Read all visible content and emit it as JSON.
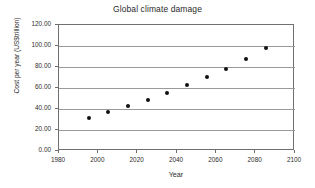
{
  "chart_data": {
    "type": "scatter",
    "title": "Global climate damage",
    "xlabel": "Year",
    "ylabel": "Cost per year (US$trillion)",
    "xlim": [
      1980,
      2100
    ],
    "ylim": [
      0,
      120
    ],
    "grid": true,
    "legend": "none",
    "xticks": [
      1980,
      2000,
      2020,
      2040,
      2060,
      2080,
      2100
    ],
    "xtick_labels": [
      "1980",
      "2000",
      "2020",
      "2040",
      "2060",
      "2080",
      "2100"
    ],
    "yticks": [
      0,
      20,
      40,
      60,
      80,
      100,
      120
    ],
    "ytick_labels": [
      "0.00",
      "20.00",
      "40.00",
      "60.00",
      "80.00",
      "100.00",
      "120.00"
    ],
    "x": [
      1995,
      2005,
      2015,
      2025,
      2035,
      2045,
      2055,
      2065,
      2075,
      2085
    ],
    "values": [
      31.5,
      37.5,
      43.0,
      49.0,
      55.5,
      62.5,
      70.5,
      78.5,
      87.5,
      98.0
    ],
    "series": [
      {
        "name": "Cost per year",
        "marker": "filled-circle",
        "color": "#111111",
        "points": [
          {
            "x": 1995,
            "y": 31.5
          },
          {
            "x": 2005,
            "y": 37.5
          },
          {
            "x": 2015,
            "y": 43.0
          },
          {
            "x": 2025,
            "y": 49.0
          },
          {
            "x": 2035,
            "y": 55.5
          },
          {
            "x": 2045,
            "y": 62.5
          },
          {
            "x": 2055,
            "y": 70.5
          },
          {
            "x": 2065,
            "y": 78.5
          },
          {
            "x": 2075,
            "y": 87.5
          },
          {
            "x": 2085,
            "y": 98.0
          }
        ]
      }
    ]
  }
}
